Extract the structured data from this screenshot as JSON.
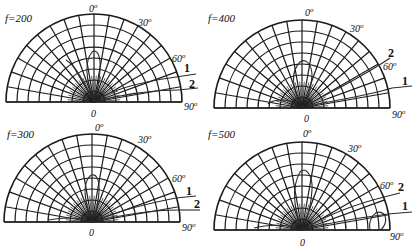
{
  "chart_data": [
    {
      "type": "polar",
      "title": "f=200",
      "angle_ticks": [
        "0°",
        "30°",
        "60°",
        "90°"
      ],
      "radial_origin_label": "0",
      "series": [
        {
          "name": "1",
          "description": "radiation pattern curve 1"
        },
        {
          "name": "2",
          "description": "radiation pattern curve 2"
        }
      ],
      "center": [
        94,
        102
      ],
      "radius": 88,
      "legend_order": [
        "1",
        "2"
      ]
    },
    {
      "type": "polar",
      "title": "f=400",
      "angle_ticks": [
        "0°",
        "30°",
        "60°",
        "90°"
      ],
      "radial_origin_label": "0",
      "series": [
        {
          "name": "2",
          "description": "radiation pattern curve 2"
        },
        {
          "name": "1",
          "description": "radiation pattern curve 1"
        }
      ],
      "center": [
        302,
        108
      ],
      "radius": 88,
      "legend_order": [
        "2",
        "1"
      ]
    },
    {
      "type": "polar",
      "title": "f=300",
      "angle_ticks": [
        "0°",
        "30°",
        "60°",
        "90°"
      ],
      "radial_origin_label": "0",
      "series": [
        {
          "name": "1",
          "description": "radiation pattern curve 1"
        },
        {
          "name": "2",
          "description": "radiation pattern curve 2"
        }
      ],
      "center": [
        92,
        222
      ],
      "radius": 88,
      "legend_order": [
        "1",
        "2"
      ]
    },
    {
      "type": "polar",
      "title": "f=500",
      "angle_ticks": [
        "0°",
        "30°",
        "60°",
        "90°"
      ],
      "radial_origin_label": "0",
      "series": [
        {
          "name": "2",
          "description": "radiation pattern curve 2"
        },
        {
          "name": "1",
          "description": "radiation pattern curve 1"
        }
      ],
      "center": [
        302,
        230
      ],
      "radius": 88,
      "legend_order": [
        "2",
        "1"
      ]
    }
  ],
  "panels": [
    {
      "title": "f=200",
      "ticks": {
        "t0": "0",
        "t30": "30",
        "t60": "60",
        "t90": "90",
        "deg": "o",
        "origin": "0"
      },
      "labels": {
        "a": "1",
        "b": "2"
      }
    },
    {
      "title": "f=400",
      "ticks": {
        "t0": "0",
        "t30": "30",
        "t60": "60",
        "t90": "90",
        "deg": "o",
        "origin": "0"
      },
      "labels": {
        "a": "2",
        "b": "1"
      }
    },
    {
      "title": "f=300",
      "ticks": {
        "t0": "0",
        "t30": "30",
        "t60": "60",
        "t90": "90",
        "deg": "o",
        "origin": "0"
      },
      "labels": {
        "a": "1",
        "b": "2"
      }
    },
    {
      "title": "f=500",
      "ticks": {
        "t0": "0",
        "t30": "30",
        "t60": "60",
        "t90": "90",
        "deg": "o",
        "origin": "0"
      },
      "labels": {
        "a": "2",
        "b": "1"
      }
    }
  ]
}
